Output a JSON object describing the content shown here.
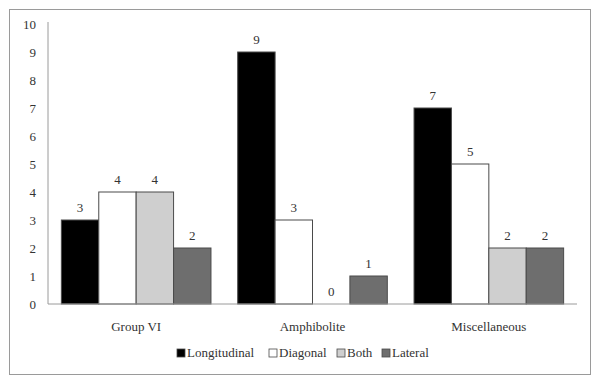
{
  "chart_data": {
    "type": "bar",
    "title": "",
    "xlabel": "",
    "ylabel": "",
    "ylim": [
      0,
      10
    ],
    "yticks": [
      0,
      1,
      2,
      3,
      4,
      5,
      6,
      7,
      8,
      9,
      10
    ],
    "grid": false,
    "legend_position": "bottom",
    "categories": [
      "Group VI",
      "Amphibolite",
      "Miscellaneous"
    ],
    "series": [
      {
        "name": "Longitudinal",
        "color": "#000000",
        "values": [
          3,
          9,
          7
        ]
      },
      {
        "name": "Diagonal",
        "color": "#ffffff",
        "values": [
          4,
          3,
          5
        ]
      },
      {
        "name": "Both",
        "color": "#cfcfcf",
        "values": [
          4,
          0,
          2
        ]
      },
      {
        "name": "Lateral",
        "color": "#6e6e6e",
        "values": [
          2,
          1,
          2
        ]
      }
    ],
    "data_labels": true
  },
  "colors": {
    "axis": "#9a9a9a",
    "bar_border": "#4a4a4a",
    "frame": "#9a9a9a"
  }
}
